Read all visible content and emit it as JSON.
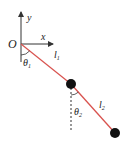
{
  "diagram": {
    "labels": {
      "origin": "O",
      "x_axis": "x",
      "y_axis": "y",
      "theta1": "θ",
      "theta1_sub": "1",
      "theta2": "θ",
      "theta2_sub": "2",
      "l1": "l",
      "l1_sub": "1",
      "l2": "l",
      "l2_sub": "2"
    },
    "colors": {
      "rod": "#d9534f",
      "axis": "#333333",
      "mass": "#111111"
    },
    "points": {
      "origin": [
        21,
        44
      ],
      "mass1": [
        71,
        84
      ],
      "mass2": [
        115,
        133
      ]
    }
  }
}
